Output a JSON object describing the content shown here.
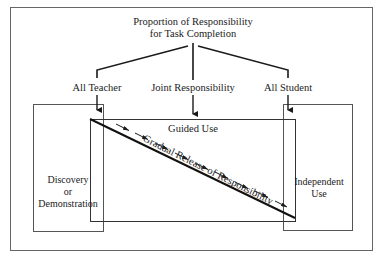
{
  "title": {
    "line1": "Proportion of Responsibility",
    "line2": "for Task Completion"
  },
  "levels": {
    "left": "All Teacher",
    "center": "Joint Responsibility",
    "right": "All Student"
  },
  "phases": {
    "left": {
      "line1": "Discovery",
      "line2": "or",
      "line3": "Demonstration"
    },
    "center": "Guided Use",
    "right": {
      "line1": "Independent",
      "line2": "Use"
    }
  },
  "diagonal_label": "Gradual Release of Responsibility",
  "colors": {
    "line": "#1a1a1a",
    "box_border": "#555555",
    "text": "#222222",
    "background": "#ffffff"
  }
}
